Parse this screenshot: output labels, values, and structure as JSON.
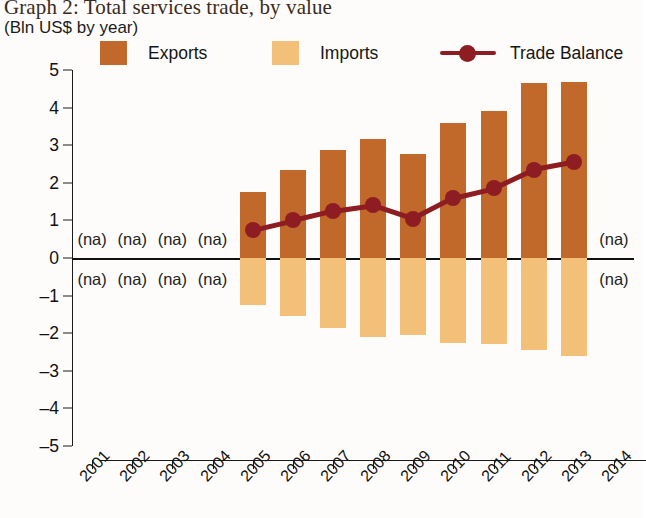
{
  "title": {
    "main": "Graph 2: Total services trade, by value",
    "sub": "(Bln US$ by year)"
  },
  "legend": {
    "items": [
      {
        "label": "Exports",
        "type": "swatch",
        "color": "#c1682b",
        "name": "legend-exports"
      },
      {
        "label": "Imports",
        "type": "swatch",
        "color": "#f2c078",
        "name": "legend-imports"
      },
      {
        "label": "Trade Balance",
        "type": "line",
        "color": "#8e1d23",
        "name": "legend-trade-balance"
      }
    ]
  },
  "na_text": "(na)",
  "colors": {
    "exports": "#c1682b",
    "imports": "#f2c078",
    "trade_balance": "#8e1d23",
    "axis": "#1a1a1a"
  },
  "chart_data": {
    "type": "bar",
    "title": "Graph 2: Total services trade, by value",
    "subtitle": "(Bln US$ by year)",
    "xlabel": "",
    "ylabel": "Bln US$",
    "ylim": [
      -5,
      5
    ],
    "ytick_labels": [
      "5",
      "4",
      "3",
      "2",
      "1",
      "0",
      "–1",
      "–2",
      "–3",
      "–4",
      "–5"
    ],
    "ytick_values": [
      5,
      4,
      3,
      2,
      1,
      0,
      -1,
      -2,
      -3,
      -4,
      -5
    ],
    "grid": false,
    "legend_position": "top",
    "categories": [
      "2001",
      "2002",
      "2003",
      "2004",
      "2005",
      "2006",
      "2007",
      "2008",
      "2009",
      "2010",
      "2011",
      "2012",
      "2013",
      "2014"
    ],
    "series": [
      {
        "name": "Exports",
        "type": "bar",
        "color": "#c1682b",
        "values": [
          null,
          null,
          null,
          null,
          1.75,
          2.35,
          2.87,
          3.16,
          2.77,
          3.59,
          3.91,
          4.65,
          4.68,
          null
        ]
      },
      {
        "name": "Imports",
        "type": "bar",
        "color": "#f2c078",
        "values": [
          null,
          null,
          null,
          null,
          -1.25,
          -1.55,
          -1.85,
          -2.1,
          -2.05,
          -2.25,
          -2.3,
          -2.45,
          -2.6,
          null
        ]
      },
      {
        "name": "Trade Balance",
        "type": "line",
        "color": "#8e1d23",
        "values": [
          null,
          null,
          null,
          null,
          0.75,
          1.0,
          1.25,
          1.4,
          1.05,
          1.6,
          1.85,
          2.35,
          2.55,
          null
        ]
      }
    ],
    "missing_data_marker": "(na)",
    "missing_data_years": [
      "2001",
      "2002",
      "2003",
      "2004",
      "2014"
    ]
  }
}
